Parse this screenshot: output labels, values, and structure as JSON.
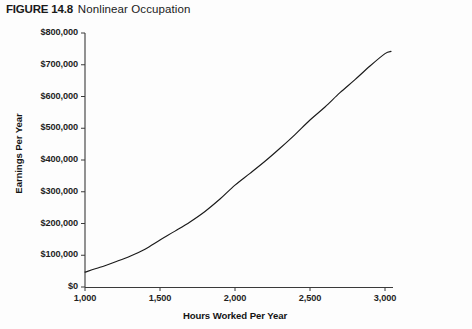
{
  "figure": {
    "number": "FIGURE 14.8",
    "caption": "Nonlinear Occupation"
  },
  "chart_data": {
    "type": "line",
    "title": "Nonlinear Occupation",
    "xlabel": "Hours Worked Per Year",
    "ylabel": "Earnings Per Year",
    "xlim": [
      1000,
      3000
    ],
    "ylim": [
      0,
      800000
    ],
    "grid": false,
    "legend": false,
    "x_ticks": [
      1000,
      1500,
      2000,
      2500,
      3000
    ],
    "x_tick_labels": [
      "1,000",
      "1,500",
      "2,000",
      "2,500",
      "3,000"
    ],
    "y_ticks": [
      0,
      100000,
      200000,
      300000,
      400000,
      500000,
      600000,
      700000,
      800000
    ],
    "y_tick_labels": [
      "$0",
      "$100,000",
      "$200,000",
      "$300,000",
      "$400,000",
      "$500,000",
      "$600,000",
      "$700,000",
      "$800,000"
    ],
    "line_color": "#1a1a1a",
    "series": [
      {
        "name": "Earnings",
        "x": [
          1000,
          1100,
          1200,
          1300,
          1400,
          1500,
          1600,
          1700,
          1800,
          1900,
          2000,
          2100,
          2200,
          2300,
          2400,
          2500,
          2600,
          2700,
          2800,
          2900,
          3000,
          3040
        ],
        "values": [
          47000,
          62000,
          79000,
          97000,
          119000,
          148000,
          176000,
          205000,
          238000,
          277000,
          321000,
          358000,
          396000,
          437000,
          480000,
          526000,
          567000,
          612000,
          653000,
          696000,
          735000,
          742000
        ]
      }
    ]
  }
}
